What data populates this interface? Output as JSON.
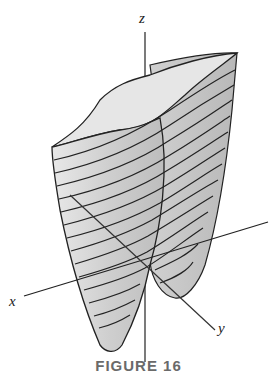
{
  "figure": {
    "caption": "FIGURE 16",
    "axes": {
      "x_label": "x",
      "y_label": "y",
      "z_label": "z"
    },
    "surface": {
      "description": "3D surface with horizontal level-curve contour lines; two lobes meeting near origin",
      "fill_color": "#d9d9d9",
      "contour_color": "#222222",
      "contour_count": 16
    }
  }
}
